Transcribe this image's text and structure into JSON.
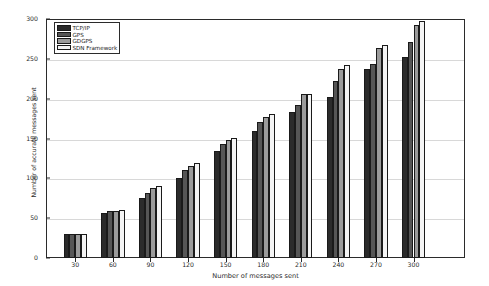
{
  "chart_data": {
    "type": "bar",
    "title": "",
    "xlabel": "Number of messages sent",
    "ylabel": "Number of accurate messages sent",
    "categories": [
      "30",
      "60",
      "90",
      "120",
      "150",
      "180",
      "210",
      "240",
      "270",
      "300"
    ],
    "xlim": [
      0,
      10
    ],
    "ylim": [
      0,
      300
    ],
    "yticks": [
      "0",
      "50",
      "100",
      "150",
      "200",
      "250",
      "300"
    ],
    "grid": true,
    "legend_position": "upper left",
    "series": [
      {
        "name": "TCP/IP",
        "color": "#2b2b2b",
        "values": [
          30,
          57,
          75,
          101,
          134,
          159,
          183,
          202,
          237,
          252
        ]
      },
      {
        "name": "GPS",
        "color": "#565656",
        "values": [
          30,
          59,
          81,
          110,
          143,
          171,
          192,
          222,
          243,
          271
        ]
      },
      {
        "name": "GDGPS",
        "color": "#9b9b9b",
        "values": [
          30,
          59,
          88,
          116,
          148,
          177,
          206,
          237,
          264,
          292
        ]
      },
      {
        "name": "SDN Framework",
        "color": "#f4f4f4",
        "values": [
          30,
          60,
          91,
          119,
          151,
          181,
          206,
          242,
          268,
          297
        ]
      }
    ]
  }
}
